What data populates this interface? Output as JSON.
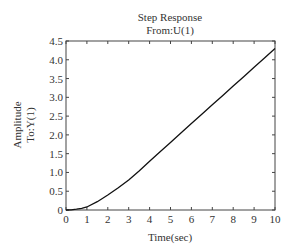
{
  "chart_data": {
    "type": "line",
    "title": "Step Response",
    "subtitle": "From:U(1)",
    "xlabel": "Time(sec)",
    "ylabel": "Amplitude",
    "ylabel2": "To:Y(1)",
    "xlim": [
      0,
      10
    ],
    "ylim": [
      0,
      4.5
    ],
    "grid": false,
    "legend": null,
    "x_ticks": [
      0,
      1,
      2,
      3,
      4,
      5,
      6,
      7,
      8,
      9,
      10
    ],
    "x_tick_labels": [
      "0",
      "1",
      "2",
      "3",
      "4",
      "5",
      "6",
      "7",
      "8",
      "9",
      "10"
    ],
    "y_ticks": [
      0,
      0.5,
      1.0,
      1.5,
      2.0,
      2.5,
      3.0,
      3.5,
      4.0,
      4.5
    ],
    "y_tick_labels": [
      "0",
      "0.5",
      "1.0",
      "1.5",
      "2.0",
      "2.5",
      "3.0",
      "3.5",
      "4.0",
      "4.5"
    ],
    "series": [
      {
        "name": "Step response",
        "color": "#111111",
        "x": [
          0,
          0.25,
          0.5,
          0.75,
          1,
          1.5,
          2,
          2.5,
          3,
          3.5,
          4,
          4.5,
          5,
          5.5,
          6,
          6.5,
          7,
          7.5,
          8,
          8.5,
          9,
          9.5,
          10
        ],
        "y": [
          0,
          0.005,
          0.02,
          0.045,
          0.08,
          0.22,
          0.4,
          0.59,
          0.8,
          1.04,
          1.3,
          1.55,
          1.8,
          2.05,
          2.3,
          2.55,
          2.8,
          3.05,
          3.3,
          3.55,
          3.8,
          4.05,
          4.3
        ]
      }
    ]
  },
  "layout": {
    "plot": {
      "left": 66,
      "top": 41,
      "right": 275,
      "bottom": 210
    }
  }
}
